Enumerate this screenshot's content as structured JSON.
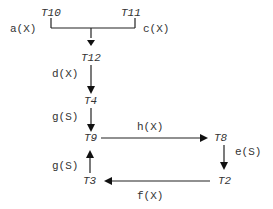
{
  "nodes": {
    "t10": "T10",
    "t11": "T11",
    "t12": "T12",
    "t4": "T4",
    "t9": "T9",
    "t8": "T8",
    "t2": "T2",
    "t3": "T3"
  },
  "edges": {
    "a": "a(X)",
    "c": "c(X)",
    "d": "d(X)",
    "g1": "g(S)",
    "h": "h(X)",
    "e": "e(S)",
    "f": "f(X)",
    "g2": "g(S)"
  },
  "colors": {
    "line": "#222222",
    "text": "#333333"
  }
}
